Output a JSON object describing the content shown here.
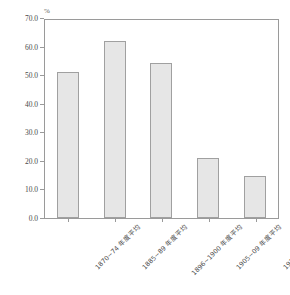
{
  "chart_data": {
    "type": "bar",
    "title": "",
    "subtitle": "",
    "xlabel": "",
    "ylabel": "",
    "unit_label": "%",
    "categories": [
      "1870~74 年度平均",
      "1885~89 年度平均",
      "1896~1900 年度平均",
      "1905~09 年度平均",
      "1914~18 年度平均"
    ],
    "values": [
      51.2,
      61.8,
      54.3,
      20.9,
      14.6
    ],
    "ylim": [
      0.0,
      70.0
    ],
    "ytick_step": 10.0,
    "ytick_labels": [
      "0.0",
      "10.0",
      "20.0",
      "30.0",
      "40.0",
      "50.0",
      "60.0",
      "70.0"
    ],
    "ytick_values": [
      0.0,
      10.0,
      20.0,
      30.0,
      40.0,
      50.0,
      60.0,
      70.0
    ],
    "grid": false,
    "legend": null,
    "colors": {
      "bar_fill": "#e6e6e6",
      "bar_border": "#a0a0a0",
      "axis": "#9a9a9a",
      "text": "#4a4a4a",
      "background": "#ffffff"
    }
  }
}
